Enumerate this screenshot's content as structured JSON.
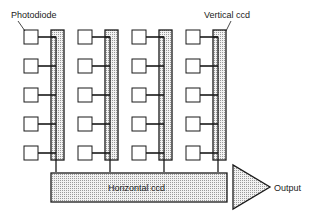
{
  "diagram": {
    "labels": {
      "photodiode": "Photodiode",
      "vertical_ccd": "Vertical ccd",
      "horizontal_ccd": "Horizontal ccd",
      "output": "Output"
    },
    "columns": 4,
    "rows": 5,
    "colors": {
      "line": "#1a1a1a",
      "fill_ccd": "#d9d9d9",
      "background": "#ffffff"
    }
  }
}
